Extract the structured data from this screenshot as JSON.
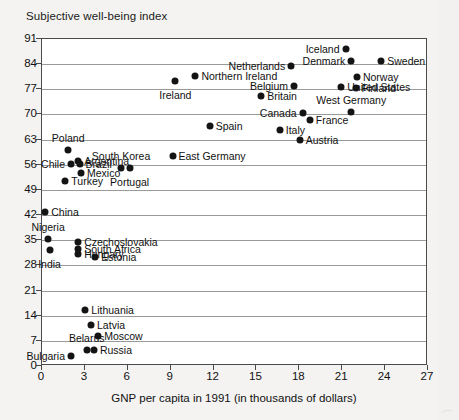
{
  "chart": {
    "title": "Subjective well-being index",
    "xlabel": "GNP per capita in 1991 (in thousands of dollars)"
  },
  "chart_data": {
    "type": "scatter",
    "title": "Subjective well-being index",
    "xlabel": "GNP per capita in 1991 (in thousands of dollars)",
    "ylabel": "Subjective well-being index",
    "xlim": [
      0,
      27
    ],
    "ylim": [
      0,
      91
    ],
    "xticks": [
      0,
      3,
      6,
      9,
      12,
      15,
      18,
      21,
      24,
      27
    ],
    "yticks": [
      0,
      7,
      14,
      21,
      28,
      35,
      42,
      49,
      56,
      63,
      70,
      77,
      84,
      91
    ],
    "grid": "horizontal",
    "legend": "none",
    "points": [
      {
        "label": "Iceland",
        "x": 21.3,
        "y": 88.0,
        "lpos": "left"
      },
      {
        "label": "Sweden",
        "x": 23.8,
        "y": 84.5,
        "lpos": "right"
      },
      {
        "label": "Denmark",
        "x": 21.7,
        "y": 84.6,
        "lpos": "left"
      },
      {
        "label": "Netherlands",
        "x": 17.5,
        "y": 83.3,
        "lpos": "left"
      },
      {
        "label": "Norway",
        "x": 22.1,
        "y": 80.2,
        "lpos": "right"
      },
      {
        "label": "Northern Ireland",
        "x": 10.8,
        "y": 80.5,
        "lpos": "right"
      },
      {
        "label": "Ireland",
        "x": 9.4,
        "y": 79.1,
        "lpos": "below"
      },
      {
        "label": "Belgium",
        "x": 17.7,
        "y": 77.6,
        "lpos": "left"
      },
      {
        "label": "United States",
        "x": 21.0,
        "y": 77.5,
        "lpos": "right"
      },
      {
        "label": "Finland",
        "x": 22.0,
        "y": 77.0,
        "lpos": "right"
      },
      {
        "label": "Britain",
        "x": 15.4,
        "y": 74.9,
        "lpos": "right"
      },
      {
        "label": "West Germany",
        "x": 21.7,
        "y": 70.3,
        "lpos": "above"
      },
      {
        "label": "Canada",
        "x": 18.3,
        "y": 70.0,
        "lpos": "left"
      },
      {
        "label": "France",
        "x": 18.8,
        "y": 68.1,
        "lpos": "right"
      },
      {
        "label": "Italy",
        "x": 16.7,
        "y": 65.5,
        "lpos": "right"
      },
      {
        "label": "Austria",
        "x": 18.1,
        "y": 62.5,
        "lpos": "right"
      },
      {
        "label": "Spain",
        "x": 11.8,
        "y": 66.5,
        "lpos": "right"
      },
      {
        "label": "East Germany",
        "x": 9.2,
        "y": 58.2,
        "lpos": "right"
      },
      {
        "label": "Poland",
        "x": 1.9,
        "y": 59.8,
        "lpos": "above"
      },
      {
        "label": "Argentina",
        "x": 2.6,
        "y": 56.8,
        "lpos": "right"
      },
      {
        "label": "Chile",
        "x": 2.1,
        "y": 55.9,
        "lpos": "left"
      },
      {
        "label": "Brazil",
        "x": 2.7,
        "y": 55.9,
        "lpos": "right"
      },
      {
        "label": "Mexico",
        "x": 2.8,
        "y": 53.4,
        "lpos": "right"
      },
      {
        "label": "South Korea",
        "x": 5.6,
        "y": 54.9,
        "lpos": "above"
      },
      {
        "label": "Portugal",
        "x": 6.2,
        "y": 54.9,
        "lpos": "below"
      },
      {
        "label": "Turkey",
        "x": 1.7,
        "y": 51.3,
        "lpos": "right"
      },
      {
        "label": "China",
        "x": 0.3,
        "y": 42.5,
        "lpos": "right"
      },
      {
        "label": "Nigeria",
        "x": 0.5,
        "y": 35.0,
        "lpos": "above"
      },
      {
        "label": "Czechoslovakia",
        "x": 2.6,
        "y": 34.2,
        "lpos": "right"
      },
      {
        "label": "South Africa",
        "x": 2.6,
        "y": 32.4,
        "lpos": "right"
      },
      {
        "label": "India",
        "x": 0.6,
        "y": 31.9,
        "lpos": "below"
      },
      {
        "label": "Hungary",
        "x": 2.6,
        "y": 30.9,
        "lpos": "right"
      },
      {
        "label": "Estonia",
        "x": 3.8,
        "y": 30.1,
        "lpos": "right"
      },
      {
        "label": "Lithuania",
        "x": 3.1,
        "y": 15.2,
        "lpos": "right"
      },
      {
        "label": "Latvia",
        "x": 3.5,
        "y": 11.2,
        "lpos": "right"
      },
      {
        "label": "Moscow",
        "x": 4.0,
        "y": 8.1,
        "lpos": "right"
      },
      {
        "label": "Belarus",
        "x": 3.2,
        "y": 4.2,
        "lpos": "above"
      },
      {
        "label": "Russia",
        "x": 3.7,
        "y": 4.2,
        "lpos": "right"
      },
      {
        "label": "Bulgaria",
        "x": 2.1,
        "y": 2.6,
        "lpos": "left"
      }
    ]
  }
}
